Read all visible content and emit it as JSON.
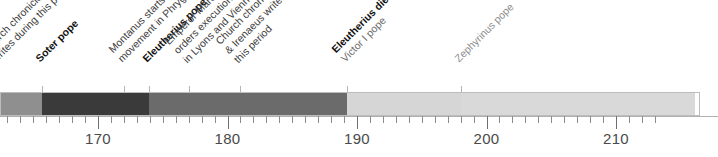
{
  "chart_data": {
    "type": "bar",
    "title": "",
    "xlabel": "",
    "ylabel": "",
    "orientation": "horizontal-timeline",
    "xlim": [
      162.3,
      213.7
    ],
    "grid": false,
    "legend": null,
    "axis": {
      "major_ticks": [
        170,
        180,
        190,
        200,
        210
      ],
      "major_tick_labels": [
        "170",
        "180",
        "190",
        "200",
        "210"
      ],
      "minor_tick_step": 1,
      "minor_tick_range": [
        163,
        213
      ]
    },
    "categories": [
      "Anicetus period",
      "Soter pope",
      "Eleutherius pope",
      "Victor I pope",
      "Zephyrinus pope"
    ],
    "segments": [
      {
        "label": "Anicetus period",
        "start": 162.3,
        "end": 165.7,
        "color": "#8f8f8f"
      },
      {
        "label": "Soter pope",
        "start": 165.7,
        "end": 173.9,
        "color": "#3a3a3a"
      },
      {
        "label": "Eleutherius pope",
        "start": 173.9,
        "end": 189.2,
        "color": "#6b6b6b"
      },
      {
        "label": "Victor I pope",
        "start": 189.2,
        "end": 198.0,
        "color": "#d6d6d6"
      },
      {
        "label": "Zephyrinus pope",
        "start": 198.0,
        "end": 216.1,
        "color": "#d9d9d9"
      }
    ],
    "annotations": [
      {
        "id": "hegesippus",
        "year": 162.3,
        "style": "regular",
        "lines": [
          "Church chronicler Hegesippus",
          "writes during this period"
        ]
      },
      {
        "id": "soter-pope",
        "year": 165.7,
        "style": "bold",
        "lines": [
          "Soter pope"
        ]
      },
      {
        "id": "montanus",
        "year": 172.0,
        "style": "regular",
        "lines": [
          "Montanus starts Montanist",
          "movement in Phrygia"
        ]
      },
      {
        "id": "eleutherius-pope",
        "year": 173.9,
        "style": "bold",
        "lines": [
          "Eleutherius pope"
        ]
      },
      {
        "id": "marcus-aurelius",
        "year": 177.0,
        "style": "regular",
        "lines": [
          "Emperor Marcus Aurelius",
          "orders execution of Christians",
          "in Lyons and Vienne"
        ]
      },
      {
        "id": "tertullian-irenaeus",
        "year": 181.0,
        "style": "regular",
        "lines": [
          "Church chroniclers Tertullian",
          "& Irenaeus write during",
          "this period"
        ]
      },
      {
        "id": "eleutherius-dies-victor",
        "year": 189.2,
        "style": "mixed",
        "lines": [
          "Eleutherius dies;",
          "Victor I pope"
        ],
        "line_styles": [
          "bold",
          "normal"
        ]
      },
      {
        "id": "zephyrinus-pope",
        "year": 198.0,
        "style": "light",
        "lines": [
          "Zephyrinus pope"
        ]
      }
    ]
  }
}
